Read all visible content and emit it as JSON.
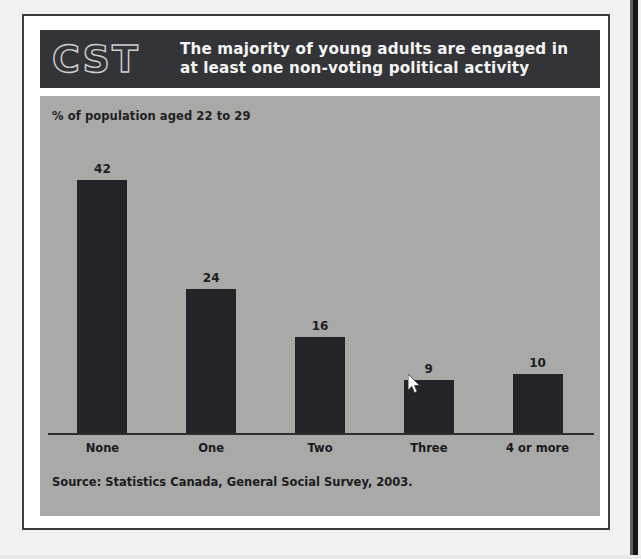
{
  "figure": {
    "logo": "CST",
    "title": "The majority of young adults are engaged in at least one non-voting political activity",
    "unit_note": "% of population aged 22 to 29",
    "source": "Source: Statistics Canada, General Social Survey, 2003."
  },
  "colors": {
    "header_band": "#333437",
    "panel_background": "#a9a9a8",
    "bar_fill": "#232427",
    "axis_line": "#2b2c2e",
    "title_text": "#f4f4f4",
    "body_text": "#1b1c1e",
    "frame_border": "#3b3d40",
    "page_background": "#f2f2f0"
  },
  "cursor": {
    "icon": "arrow-pointer-icon",
    "x": 410,
    "y": 378
  },
  "chart_data": {
    "type": "bar",
    "title": "The majority of young adults are engaged in at least one non-voting political activity",
    "subtitle": "% of population aged 22 to 29",
    "categories": [
      "None",
      "One",
      "Two",
      "Three",
      "4 or more"
    ],
    "values": [
      42,
      24,
      16,
      9,
      10
    ],
    "data_labels": [
      "42",
      "24",
      "16",
      "9",
      "10"
    ],
    "xlabel": "Number of non-traditional political activities",
    "ylabel": "% of population aged 22 to 29",
    "ylim": [
      0,
      48
    ],
    "grid": false,
    "legend": false,
    "source": "Source: Statistics Canada, General Social Survey, 2003."
  }
}
